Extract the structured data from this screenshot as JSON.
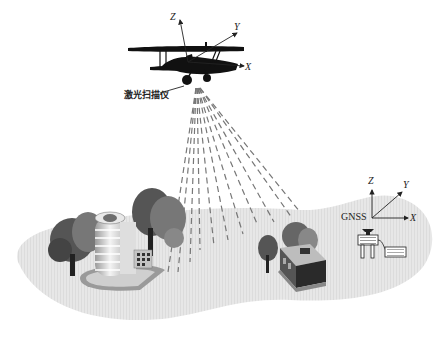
{
  "diagram": {
    "aircraft": {
      "label": "激光扫描仪",
      "axes": {
        "x": "X",
        "y": "Y",
        "z": "Z"
      }
    },
    "ground_station": {
      "label": "GNSS",
      "axes": {
        "x": "X",
        "y": "Y",
        "z": "Z"
      }
    },
    "objects": [
      {
        "name": "office-building",
        "kind": "building"
      },
      {
        "name": "small-shop",
        "kind": "building"
      },
      {
        "name": "trees",
        "kind": "vegetation"
      }
    ],
    "colors": {
      "ground": "#e6e6e6",
      "silhouette": "#111111",
      "beam": "#777777",
      "tree": "#5a5a5a"
    }
  }
}
